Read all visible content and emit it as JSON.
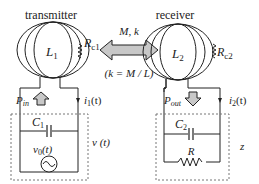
{
  "transmitter": {
    "title": "transmitter",
    "inductor": "L",
    "inductor_sub": "1",
    "resistor": "R",
    "resistor_sub": "c1",
    "power_label": "P",
    "power_sub": "in",
    "current_label": "i",
    "current_sub": "1",
    "current_arg": "(t)",
    "capacitor": "C",
    "capacitor_sub": "1",
    "source": "v",
    "source_sub": "0",
    "source_arg": "(t)",
    "voltage_label": "v (t)"
  },
  "receiver": {
    "title": "receiver",
    "inductor": "L",
    "inductor_sub": "2",
    "resistor": "R",
    "resistor_sub": "c2",
    "power_label": "P",
    "power_sub": "out",
    "current_label": "i",
    "current_sub": "2",
    "current_arg": "(t)",
    "capacitor": "C",
    "capacitor_sub": "2",
    "load": "R",
    "impedance_label": "z"
  },
  "coupling": {
    "label": "M, k",
    "formula": "(k = M / L)"
  },
  "colors": {
    "line": "#222222",
    "arrow_fill": "#c8c8c8",
    "dashed": "#777777"
  }
}
